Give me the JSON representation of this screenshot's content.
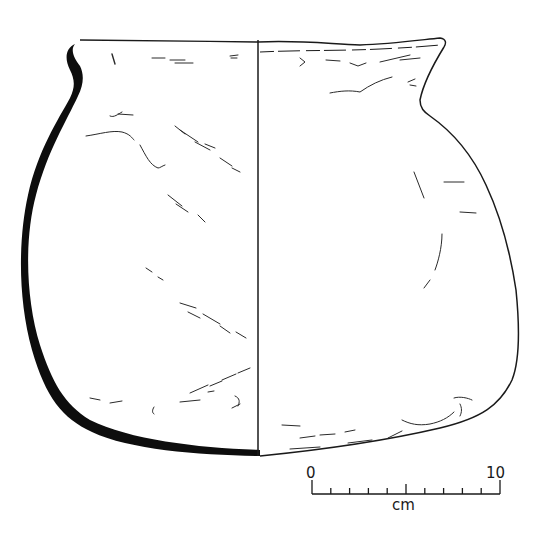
{
  "figure": {
    "views": [
      "section",
      "exterior"
    ],
    "colors": {
      "line": "#1a1a1a",
      "section_fill": "#0d0d0d",
      "background": "#ffffff"
    }
  },
  "scale_bar": {
    "start_label": "0",
    "end_label": "10",
    "unit_label": "cm",
    "divisions": 10
  }
}
